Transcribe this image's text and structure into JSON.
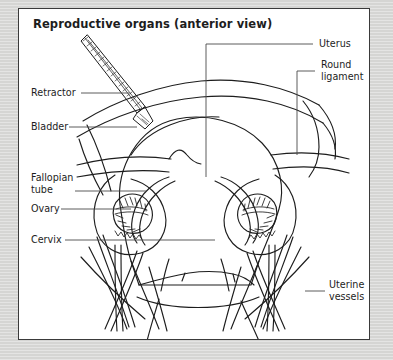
{
  "figure": {
    "title": "Reproductive organs (anterior view)",
    "border_color": "#3a3a3a",
    "panel_background": "#ffffff",
    "page_background": "#d9d9d7",
    "ink_color": "#1d1d1d"
  },
  "labels": {
    "retractor": "Retractor",
    "bladder": "Bladder",
    "fallopian_tube_line1": "Fallopian",
    "fallopian_tube_line2": "tube",
    "ovary": "Ovary",
    "cervix": "Cervix",
    "uterus": "Uterus",
    "round_ligament_line1": "Round",
    "round_ligament_line2": "ligament",
    "uterine_vessels_line1": "Uterine",
    "uterine_vessels_line2": "vessels"
  }
}
